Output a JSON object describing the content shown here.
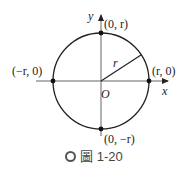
{
  "diagram": {
    "labels": {
      "y_axis": "y",
      "x_axis": "x",
      "origin": "O",
      "radius": "r",
      "top_point": "(0, r)",
      "bottom_point": "(0, −r)",
      "left_point": "(−r, 0)",
      "right_point": "(r, 0)"
    },
    "caption": {
      "figure_word": "圖",
      "figure_number": "1-20"
    },
    "colors": {
      "stroke": "#222222",
      "axis": "#666666"
    }
  }
}
